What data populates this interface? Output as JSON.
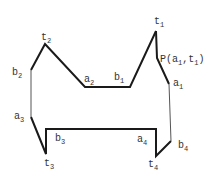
{
  "diagram": {
    "type": "polygon-outline",
    "stroke_color": "#1a1a1a",
    "thin_stroke_color": "#555555",
    "vertices": [
      {
        "id": "t2",
        "x": 45,
        "y": 44
      },
      {
        "id": "a2",
        "x": 85,
        "y": 87
      },
      {
        "id": "b1",
        "x": 130,
        "y": 87
      },
      {
        "id": "t1",
        "x": 156,
        "y": 31
      },
      {
        "id": "P",
        "x": 157,
        "y": 58
      },
      {
        "id": "a1",
        "x": 169,
        "y": 84
      },
      {
        "id": "b4",
        "x": 171,
        "y": 141
      },
      {
        "id": "t4",
        "x": 156,
        "y": 156
      },
      {
        "id": "a4",
        "x": 156,
        "y": 129
      },
      {
        "id": "b3",
        "x": 46,
        "y": 129
      },
      {
        "id": "t3",
        "x": 46,
        "y": 154
      },
      {
        "id": "a3",
        "x": 31,
        "y": 117
      },
      {
        "id": "b2",
        "x": 31,
        "y": 70
      }
    ],
    "labels": {
      "t1": {
        "base": "t",
        "sub": "1"
      },
      "t2": {
        "base": "t",
        "sub": "2"
      },
      "t3": {
        "base": "t",
        "sub": "3"
      },
      "t4": {
        "base": "t",
        "sub": "4"
      },
      "a1": {
        "base": "a",
        "sub": "1"
      },
      "a2": {
        "base": "a",
        "sub": "2"
      },
      "a3": {
        "base": "a",
        "sub": "3"
      },
      "a4": {
        "base": "a",
        "sub": "4"
      },
      "b1": {
        "base": "b",
        "sub": "1"
      },
      "b2": {
        "base": "b",
        "sub": "2"
      },
      "b3": {
        "base": "b",
        "sub": "3"
      },
      "b4": {
        "base": "b",
        "sub": "4"
      },
      "P": {
        "prefix": "P(a",
        "sub1": "1",
        "mid": ",t",
        "sub2": "1",
        "suffix": ")"
      }
    }
  }
}
